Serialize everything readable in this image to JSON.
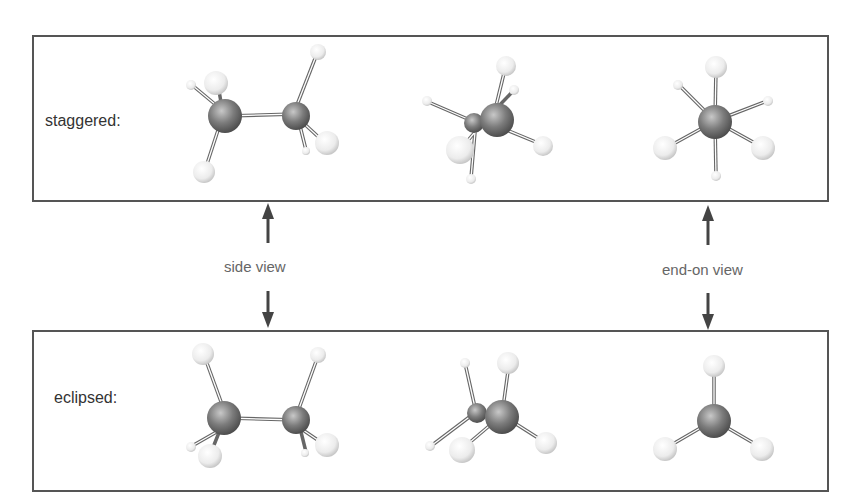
{
  "diagram": {
    "panels": [
      {
        "id": "staggered",
        "label": "staggered:"
      },
      {
        "id": "eclipsed",
        "label": "eclipsed:"
      }
    ],
    "views": {
      "side": {
        "label": "side view"
      },
      "end_on": {
        "label": "end-on view"
      }
    },
    "columns": [
      "side view",
      "tilted view",
      "end-on view"
    ],
    "colors": {
      "carbon": "#777777",
      "hydrogen": "#ececec",
      "frame": "#555555",
      "arrow": "#444444",
      "view_label": "#666666"
    }
  }
}
